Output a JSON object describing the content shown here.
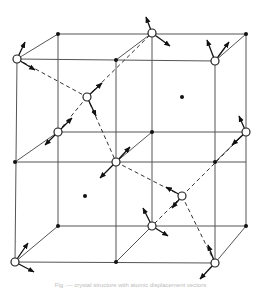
{
  "figure": {
    "colors": {
      "lines": "#555555",
      "atoms": "#111111",
      "background": "#ffffff"
    },
    "lattice_points": [
      {
        "id": "btl",
        "x": 58,
        "y": 34
      },
      {
        "id": "btr",
        "x": 246,
        "y": 34
      },
      {
        "id": "ftm",
        "x": 116,
        "y": 60
      },
      {
        "id": "bml",
        "x": 58,
        "y": 132
      },
      {
        "id": "bmc",
        "x": 152,
        "y": 132
      },
      {
        "id": "ftr_mid",
        "x": 215,
        "y": 162
      },
      {
        "id": "bbl",
        "x": 58,
        "y": 226
      },
      {
        "id": "fbm",
        "x": 116,
        "y": 262
      },
      {
        "id": "bbr",
        "x": 246,
        "y": 226
      },
      {
        "id": "bmr",
        "x": 246,
        "y": 132
      },
      {
        "id": "fml",
        "x": 15,
        "y": 162
      }
    ],
    "face_centers": [
      {
        "id": "fc_right",
        "x": 182,
        "y": 97
      },
      {
        "id": "fc_left",
        "x": 85,
        "y": 196
      }
    ],
    "open_atoms": [
      {
        "id": "a1",
        "x": 17,
        "y": 59,
        "arrows": [
          [
            25,
            42
          ],
          [
            35,
            70
          ]
        ]
      },
      {
        "id": "a2",
        "x": 152,
        "y": 33,
        "arrows": [
          [
            146,
            17
          ],
          [
            170,
            46
          ]
        ]
      },
      {
        "id": "a3",
        "x": 215,
        "y": 61,
        "arrows": [
          [
            207,
            40
          ],
          [
            229,
            42
          ]
        ]
      },
      {
        "id": "a4",
        "x": 87,
        "y": 97,
        "arrows": [
          [
            102,
            83
          ],
          [
            96,
            116
          ]
        ]
      },
      {
        "id": "a5",
        "x": 58,
        "y": 132,
        "arrows": [
          [
            72,
            118
          ],
          [
            45,
            145
          ]
        ]
      },
      {
        "id": "a6",
        "x": 246,
        "y": 132,
        "arrows": [
          [
            239,
            116
          ],
          [
            232,
            145
          ]
        ]
      },
      {
        "id": "a7",
        "x": 116,
        "y": 162,
        "arrows": [
          [
            130,
            147
          ],
          [
            100,
            178
          ]
        ]
      },
      {
        "id": "a8",
        "x": 182,
        "y": 196,
        "arrows": [
          [
            166,
            187
          ],
          [
            172,
            208
          ]
        ]
      },
      {
        "id": "a9",
        "x": 152,
        "y": 226,
        "arrows": [
          [
            143,
            208
          ],
          [
            168,
            236
          ]
        ]
      },
      {
        "id": "a10",
        "x": 15,
        "y": 262,
        "arrows": [
          [
            28,
            243
          ],
          [
            34,
            272
          ]
        ]
      },
      {
        "id": "a11",
        "x": 215,
        "y": 263,
        "arrows": [
          [
            208,
            245
          ],
          [
            200,
            279
          ]
        ]
      }
    ],
    "bonds": [
      [
        17,
        59,
        87,
        97
      ],
      [
        87,
        97,
        152,
        33
      ],
      [
        87,
        97,
        58,
        132
      ],
      [
        87,
        97,
        116,
        162
      ],
      [
        116,
        162,
        182,
        196
      ],
      [
        182,
        196,
        246,
        132
      ],
      [
        182,
        196,
        152,
        226
      ],
      [
        182,
        196,
        215,
        263
      ]
    ],
    "caption": "Fig. — crystal structure with atomic displacement vectors"
  }
}
